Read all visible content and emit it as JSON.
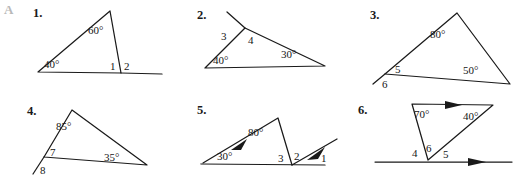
{
  "page": {
    "section_letter": "A",
    "background": "#ffffff",
    "ink_color": "#1a1a1a",
    "letter_color": "#b9b9b9"
  },
  "figures": [
    {
      "number": "1.",
      "labels": {
        "apex_angle": "60°",
        "left_angle": "40°",
        "interior_num": "1",
        "exterior_num": "2"
      }
    },
    {
      "number": "2.",
      "labels": {
        "left_angle": "40°",
        "right_angle": "30°",
        "interior_num": "3",
        "exterior_num": "4"
      }
    },
    {
      "number": "3.",
      "labels": {
        "apex_angle": "80°",
        "right_angle": "50°",
        "interior_num": "5",
        "exterior_num": "6"
      }
    },
    {
      "number": "4.",
      "labels": {
        "apex_angle": "85°",
        "right_angle": "35°",
        "interior_num": "7",
        "exterior_num": "8"
      }
    },
    {
      "number": "5.",
      "labels": {
        "apex_angle": "80°",
        "left_angle": "30°",
        "num_3": "3",
        "num_2": "2",
        "num_1": "1"
      }
    },
    {
      "number": "6.",
      "labels": {
        "top_left_angle": "70°",
        "top_right_angle": "40°",
        "num_4": "4",
        "num_6": "6",
        "num_5": "5"
      }
    }
  ]
}
